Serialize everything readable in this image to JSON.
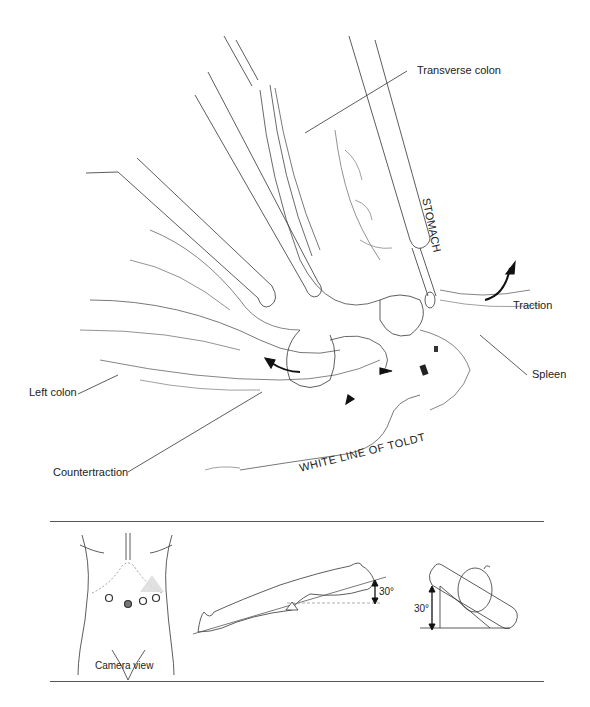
{
  "figure": {
    "main_illustration": {
      "labels": {
        "transverse_colon": "Transverse colon",
        "stomach": "STOMACH",
        "traction": "Traction",
        "spleen": "Spleen",
        "left_colon": "Left colon",
        "countertraction": "Countertraction",
        "white_line": "WHITE LINE OF TOLDT"
      }
    },
    "positioning_panel": {
      "camera_view_caption": "Camera view",
      "tilt_angle_side": "30°",
      "tilt_angle_front": "30°"
    }
  },
  "colors": {
    "line": "#333333",
    "rule": "#555555",
    "port_highlight": "#d9d9d9"
  }
}
